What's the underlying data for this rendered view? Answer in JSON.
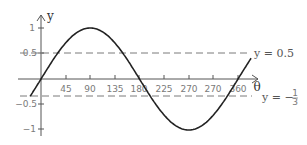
{
  "chart_data": {
    "type": "line",
    "title": "",
    "xlabel": "θ",
    "ylabel": "y",
    "function": "y = sin θ",
    "x_ticks": [
      45,
      90,
      135,
      180,
      225,
      270,
      315,
      360
    ],
    "x_tick_labels": [
      "45",
      "90",
      "135",
      "180",
      "225",
      "270",
      "270",
      "360"
    ],
    "y_ticks": [
      1,
      0.5,
      -0.5,
      -1
    ],
    "y_tick_labels": [
      "1",
      "0.5",
      "−0.5",
      "−1"
    ],
    "xlim": [
      -20,
      385
    ],
    "ylim": [
      -1,
      1
    ],
    "grid": false,
    "series": [
      {
        "name": "y = sin θ",
        "x": [
          -20,
          0,
          45,
          90,
          135,
          180,
          225,
          270,
          315,
          360,
          385
        ],
        "values": [
          -0.34,
          0,
          0.71,
          1,
          0.71,
          0,
          -0.71,
          -1,
          -0.71,
          0,
          0.42
        ]
      }
    ],
    "reference_lines": [
      {
        "name": "y = 0.5",
        "y": 0.5,
        "style": "dashed",
        "label": "y = 0.5"
      },
      {
        "name": "y = -1/3",
        "y": -0.3333,
        "style": "dashed",
        "label": "y = −⅓"
      }
    ],
    "legend": null
  },
  "labels": {
    "x_axis": "θ",
    "y_axis": "y",
    "line_half": "y = 0.5",
    "line_third_prefix": "y = −",
    "line_third_num": "1",
    "line_third_den": "3"
  },
  "colors": {
    "curve": "#222222",
    "axes": "#555555",
    "dashed": "#777777",
    "text": "#7a7a7a"
  }
}
